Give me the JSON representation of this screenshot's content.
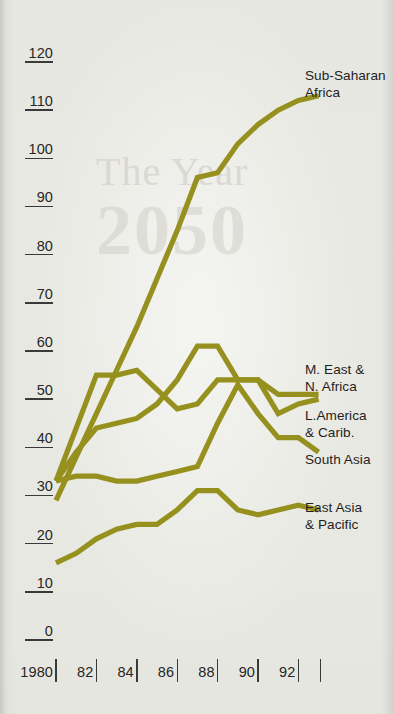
{
  "page": {
    "background_color": "#e8e8e2",
    "ink_color": "#262625",
    "series_color": "#96901f"
  },
  "watermark": {
    "line1": "The Year",
    "line2": "2050"
  },
  "chart_data": {
    "type": "line",
    "title": "",
    "subtitle": "",
    "xlabel": "",
    "ylabel": "",
    "xlim": [
      1980,
      1993.2
    ],
    "ylim": [
      0,
      120
    ],
    "grid": false,
    "legend_position": "right-inline-labels",
    "y_ticks": [
      0,
      10,
      20,
      30,
      40,
      50,
      60,
      70,
      80,
      90,
      100,
      110,
      120
    ],
    "y_tick_labels": [
      "0",
      "10",
      "20",
      "30",
      "40",
      "50",
      "60",
      "70",
      "80",
      "90",
      "100",
      "110",
      "120"
    ],
    "x_ticks": [
      1980,
      1982,
      1984,
      1986,
      1988,
      1990,
      1992
    ],
    "x_tick_labels": [
      "1980",
      "82",
      "84",
      "86",
      "88",
      "90",
      "92"
    ],
    "x": [
      1980,
      1981,
      1982,
      1983,
      1984,
      1985,
      1986,
      1987,
      1988,
      1989,
      1990,
      1991,
      1992,
      1993
    ],
    "series": [
      {
        "name": "Sub-Saharan Africa",
        "label": "Sub-Saharan\nAfrica",
        "color": "#96901f",
        "values": [
          29,
          38,
          47,
          56,
          65,
          75,
          85,
          96,
          97,
          103,
          107,
          110,
          112,
          113
        ]
      },
      {
        "name": "M. East & N. Africa",
        "label": "M. East &\nN. Africa",
        "color": "#96901f",
        "values": [
          33,
          39,
          44,
          45,
          46,
          49,
          54,
          61,
          61,
          54,
          54,
          51,
          51,
          51
        ]
      },
      {
        "name": "L.America & Carib.",
        "label": "L.America\n& Carib.",
        "color": "#96901f",
        "values": [
          33,
          44,
          55,
          55,
          56,
          52,
          48,
          49,
          54,
          54,
          54,
          47,
          49,
          50
        ]
      },
      {
        "name": "South Asia",
        "label": "South Asia",
        "color": "#96901f",
        "values": [
          33,
          34,
          34,
          33,
          33,
          34,
          35,
          36,
          45,
          53,
          47,
          42,
          42,
          39
        ]
      },
      {
        "name": "East Asia & Pacific",
        "label": "East Asia\n& Pacific",
        "color": "#96901f",
        "values": [
          16,
          18,
          21,
          23,
          24,
          24,
          27,
          31,
          31,
          27,
          26,
          27,
          28,
          27
        ]
      }
    ],
    "annotations": [
      {
        "text": "Sub-Saharan Africa",
        "at_x": 1993,
        "at_y": 113
      },
      {
        "text": "M. East & N. Africa",
        "at_x": 1993,
        "at_y": 51
      },
      {
        "text": "L.America & Carib.",
        "at_x": 1993,
        "at_y": 42
      },
      {
        "text": "South Asia",
        "at_x": 1993,
        "at_y": 39
      },
      {
        "text": "East Asia & Pacific",
        "at_x": 1993,
        "at_y": 27
      }
    ]
  }
}
